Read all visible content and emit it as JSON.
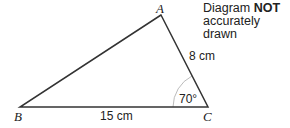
{
  "note": {
    "line1_prefix": "Diagram ",
    "line1_bold": "NOT",
    "line2": "accurately drawn"
  },
  "triangle": {
    "vertices": {
      "A": {
        "label": "A"
      },
      "B": {
        "label": "B"
      },
      "C": {
        "label": "C"
      }
    },
    "sides": {
      "AC": "8 cm",
      "BC": "15 cm"
    },
    "angle_C": "70°"
  },
  "colors": {
    "line": "#333333",
    "arc": "#aaaaaa",
    "text": "#222222"
  }
}
